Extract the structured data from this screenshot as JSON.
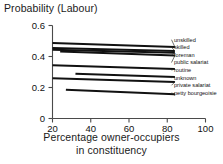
{
  "chart_data": {
    "type": "line",
    "title": "",
    "ylabel": "Probability (Labour)",
    "xlabel": "Percentage owner-occupiers in constituency",
    "xlabel_line1": "Percentage owner-occupiers",
    "xlabel_line2": "in constituency",
    "xlim": [
      20,
      100
    ],
    "ylim": [
      0,
      0.6
    ],
    "xticks": [
      "20",
      "40",
      "60",
      "80",
      "100"
    ],
    "xtick_values": [
      20,
      40,
      60,
      80,
      100
    ],
    "yticks": [
      "0",
      "0.2",
      "0.4",
      "0.6"
    ],
    "ytick_values": [
      0,
      0.2,
      0.4,
      0.6
    ],
    "grid": false,
    "legend_position": "right-inline-labels",
    "line_color": "#111111",
    "axis_color": "#4a4a4a",
    "series": [
      {
        "name": "unskilled",
        "x": [
          20,
          84
        ],
        "values": [
          0.487,
          0.461
        ]
      },
      {
        "name": "skilled",
        "x": [
          20,
          84
        ],
        "values": [
          0.455,
          0.436
        ]
      },
      {
        "name": "foreman",
        "x": [
          20,
          84
        ],
        "values": [
          0.443,
          0.424
        ]
      },
      {
        "name": "public salariat",
        "x": [
          24,
          84
        ],
        "values": [
          0.432,
          0.406
        ]
      },
      {
        "name": "routine",
        "x": [
          20,
          84
        ],
        "values": [
          0.343,
          0.32
        ]
      },
      {
        "name": "unknown",
        "x": [
          32,
          84
        ],
        "values": [
          0.288,
          0.267
        ]
      },
      {
        "name": "private salariat",
        "x": [
          20,
          84
        ],
        "values": [
          0.259,
          0.236
        ]
      },
      {
        "name": "petty bourgeoisie",
        "x": [
          27,
          84
        ],
        "values": [
          0.185,
          0.156
        ]
      }
    ],
    "legend_labels": [
      "unskilled",
      "skilled",
      "foreman",
      "public salariat",
      "routine",
      "unknown",
      "private salariat",
      "petty bourgeoisie"
    ]
  }
}
